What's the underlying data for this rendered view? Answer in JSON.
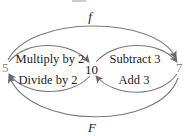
{
  "diagram": {
    "nodes": [
      {
        "id": "left",
        "label": "5"
      },
      {
        "id": "center",
        "label": "10"
      },
      {
        "id": "right",
        "label": "7"
      }
    ],
    "edges": [
      {
        "from": "left",
        "to": "right",
        "label": "f",
        "position": "outer-top"
      },
      {
        "from": "right",
        "to": "left",
        "label": "F",
        "position": "outer-bottom"
      },
      {
        "from": "left",
        "to": "center",
        "label": "Multiply by 2",
        "position": "inner-left-top"
      },
      {
        "from": "center",
        "to": "left",
        "label": "Divide by 2",
        "position": "inner-left-bottom"
      },
      {
        "from": "center",
        "to": "right",
        "label": "Subtract 3",
        "position": "inner-right-top"
      },
      {
        "from": "right",
        "to": "center",
        "label": "Add 3",
        "position": "inner-right-bottom"
      }
    ],
    "colors": {
      "edge": "#7a7a7a",
      "text": "#222222"
    }
  }
}
